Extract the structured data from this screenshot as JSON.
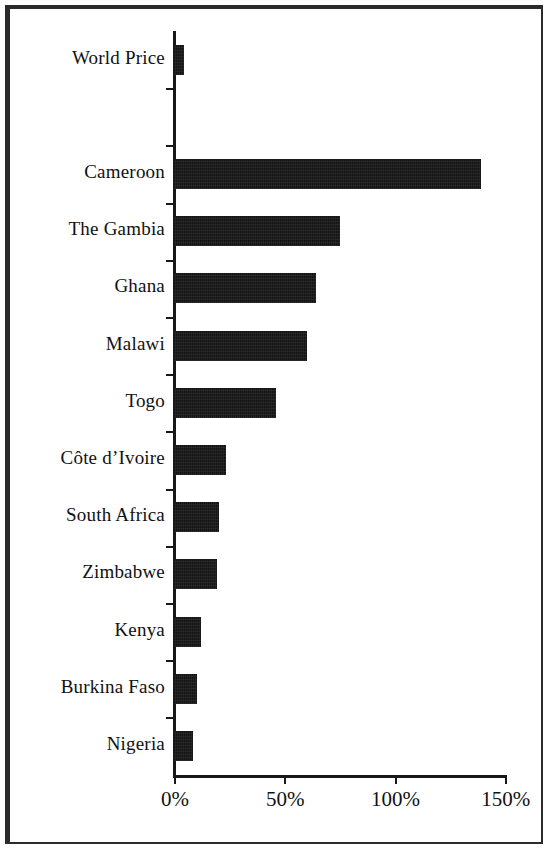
{
  "figure": {
    "background_color": "#ffffff",
    "frame_color": "#2b2b2b",
    "bar_color": "#141414",
    "axis_color": "#181818"
  },
  "chart_data": {
    "type": "bar",
    "orientation": "horizontal",
    "title": "",
    "subtitle": "",
    "xlabel": "",
    "ylabel": "",
    "grid": false,
    "legend": null,
    "xlim": [
      0,
      150
    ],
    "x_tick_values": [
      0,
      50,
      100,
      150
    ],
    "x_tick_labels": [
      "0%",
      "50%",
      "100%",
      "150%"
    ],
    "value_unit": "%",
    "categories": [
      "World Price",
      "",
      "Cameroon",
      "The Gambia",
      "Ghana",
      "Malawi",
      "Togo",
      "Côte d’Ivoire",
      "South Africa",
      "Zimbabwe",
      "Kenya",
      "Burkina Faso",
      "Nigeria"
    ],
    "values": [
      4,
      null,
      139,
      75,
      64,
      60,
      46,
      23,
      20,
      19,
      12,
      10,
      8
    ],
    "series": [
      {
        "name": "",
        "values": [
          4,
          null,
          139,
          75,
          64,
          60,
          46,
          23,
          20,
          19,
          12,
          10,
          8
        ]
      }
    ],
    "bars": [
      {
        "category": "World Price",
        "value": 4
      },
      {
        "category": "Cameroon",
        "value": 139
      },
      {
        "category": "The Gambia",
        "value": 75
      },
      {
        "category": "Ghana",
        "value": 64
      },
      {
        "category": "Malawi",
        "value": 60
      },
      {
        "category": "Togo",
        "value": 46
      },
      {
        "category": "Côte d’Ivoire",
        "value": 23
      },
      {
        "category": "South Africa",
        "value": 20
      },
      {
        "category": "Zimbabwe",
        "value": 19
      },
      {
        "category": "Kenya",
        "value": 12
      },
      {
        "category": "Burkina Faso",
        "value": 10
      },
      {
        "category": "Nigeria",
        "value": 8
      }
    ]
  },
  "axis": {
    "x_labels": [
      {
        "text": "0%",
        "value": 0
      },
      {
        "text": "50%",
        "value": 50
      },
      {
        "text": "100%",
        "value": 100
      },
      {
        "text": "150%",
        "value": 150
      }
    ],
    "y_labels": [
      {
        "text": "World Price"
      },
      {
        "text": ""
      },
      {
        "text": "Cameroon"
      },
      {
        "text": "The Gambia"
      },
      {
        "text": "Ghana"
      },
      {
        "text": "Malawi"
      },
      {
        "text": "Togo"
      },
      {
        "text": "Côte d’Ivoire"
      },
      {
        "text": "South Africa"
      },
      {
        "text": "Zimbabwe"
      },
      {
        "text": "Kenya"
      },
      {
        "text": "Burkina Faso"
      },
      {
        "text": "Nigeria"
      }
    ]
  }
}
